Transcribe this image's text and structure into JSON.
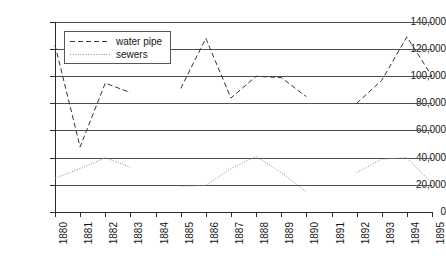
{
  "chart_data": {
    "type": "line",
    "title": "",
    "xlabel": "",
    "ylabel": "",
    "ylim": [
      0,
      140000
    ],
    "ytick_labels": [
      "140,000",
      "120,000",
      "100,000",
      "80,000",
      "60,000",
      "40,000",
      "20,000",
      "0"
    ],
    "ytick_values": [
      140000,
      120000,
      100000,
      80000,
      60000,
      40000,
      20000,
      0
    ],
    "grid": true,
    "legend_position": "upper-left-inside",
    "categories": [
      "1880",
      "1881",
      "1882",
      "1883",
      "1884",
      "1885",
      "1886",
      "1887",
      "1888",
      "1889",
      "1890",
      "1891",
      "1892",
      "1893",
      "1894",
      "1895"
    ],
    "x": [
      1880,
      1881,
      1882,
      1883,
      1884,
      1885,
      1886,
      1887,
      1888,
      1889,
      1890,
      1891,
      1892,
      1893,
      1894,
      1895
    ],
    "series": [
      {
        "name": "water pipe",
        "style": "dashed",
        "color": "#333333",
        "values": [
          123000,
          48000,
          95000,
          88000,
          null,
          91000,
          128000,
          84000,
          100000,
          99000,
          85000,
          null,
          80000,
          97000,
          129000,
          100000
        ]
      },
      {
        "name": "sewers",
        "style": "dotted",
        "color": "#8a8a8a",
        "values": [
          25000,
          32000,
          40000,
          33000,
          null,
          19000,
          19500,
          32000,
          41000,
          29000,
          15000,
          null,
          29000,
          39000,
          40000,
          21000
        ]
      }
    ]
  },
  "legend": {
    "items": [
      {
        "label": "water pipe",
        "swatch": "dashed-line-swatch"
      },
      {
        "label": "sewers",
        "swatch": "dotted-line-swatch"
      }
    ]
  }
}
